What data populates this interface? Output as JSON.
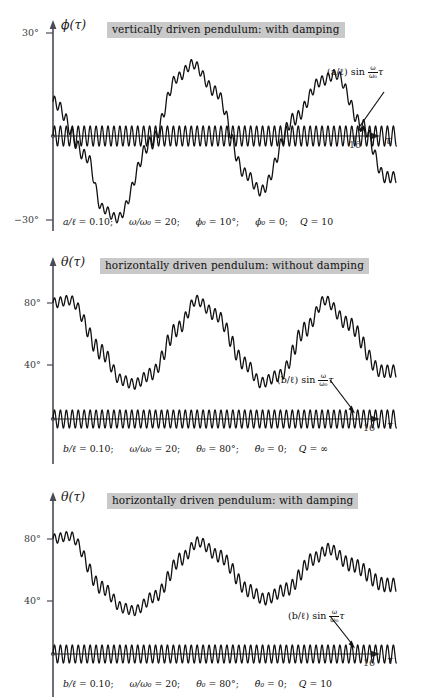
{
  "figure": {
    "type": "multi-panel-line-plot",
    "panel_count": 3,
    "background": "#ffffff",
    "banner_bg": "#c9c9c9",
    "curve_color": "#111111",
    "axis_color": "#4a4a56"
  },
  "panels": [
    {
      "id": "panel-1",
      "title": "vertically driven pendulum: with damping",
      "y_axis_label": "ϕ(τ)",
      "x_axis_label": "τ",
      "y_ticks": [
        "30°",
        "−30°"
      ],
      "y_tick_values": [
        30,
        -30
      ],
      "x_tick": "16",
      "x_tick_value": 16,
      "annotation": {
        "prefix": "(a/ℓ) sin",
        "frac_num": "ω",
        "frac_den": "ω₀",
        "suffix": "τ",
        "full": "(a/ℓ) sin (ω/ω₀)τ"
      },
      "params": [
        {
          "symbol": "a/ℓ",
          "value": "0.10"
        },
        {
          "symbol": "ω/ω₀",
          "value": "20"
        },
        {
          "symbol": "ϕ₀",
          "value": "10°"
        },
        {
          "symbol": "ϕ̇₀",
          "value": "0"
        },
        {
          "symbol": "Q",
          "value": "10"
        }
      ]
    },
    {
      "id": "panel-2",
      "title": "horizontally driven pendulum: without damping",
      "y_axis_label": "θ(τ)",
      "x_axis_label": "τ",
      "y_ticks": [
        "80°",
        "40°"
      ],
      "y_tick_values": [
        80,
        40
      ],
      "x_tick": "16",
      "x_tick_value": 16,
      "annotation": {
        "prefix": "(b/ℓ) sin",
        "frac_num": "ω",
        "frac_den": "ω₀",
        "suffix": "τ",
        "full": "(b/ℓ) sin (ω/ω₀)τ"
      },
      "params": [
        {
          "symbol": "b/ℓ",
          "value": "0.10"
        },
        {
          "symbol": "ω/ω₀",
          "value": "20"
        },
        {
          "symbol": "θ₀",
          "value": "80°"
        },
        {
          "symbol": "θ̇₀",
          "value": "0"
        },
        {
          "symbol": "Q",
          "value": "∞"
        }
      ]
    },
    {
      "id": "panel-3",
      "title": "horizontally driven pendulum: with damping",
      "y_axis_label": "θ(τ)",
      "x_axis_label": "τ",
      "y_ticks": [
        "80°",
        "40°"
      ],
      "y_tick_values": [
        80,
        40
      ],
      "x_tick": "16",
      "x_tick_value": 16,
      "annotation": {
        "prefix": "(b/ℓ) sin",
        "frac_num": "ω",
        "frac_den": "ω₀",
        "suffix": "τ",
        "full": "(b/ℓ) sin (ω/ω₀)τ"
      },
      "params": [
        {
          "symbol": "b/ℓ",
          "value": "0.10"
        },
        {
          "symbol": "ω/ω₀",
          "value": "20"
        },
        {
          "symbol": "θ₀",
          "value": "80°"
        },
        {
          "symbol": "θ̇₀",
          "value": "0"
        },
        {
          "symbol": "Q",
          "value": "10"
        }
      ]
    }
  ],
  "chart_data": [
    {
      "type": "line",
      "title": "vertically driven pendulum: with damping",
      "xlabel": "τ",
      "ylabel": "ϕ(τ)",
      "xlim": [
        0,
        18.2
      ],
      "ylim": [
        -30,
        30
      ],
      "grid": false,
      "legend": false,
      "series": [
        {
          "name": "ϕ(τ) response",
          "description": "slow large-amplitude oscillation, period ~7.2 in τ, amplitude ~22°, with superimposed fast ripple of ~1.5° at the drive frequency; weak damping (Q=10)",
          "model": {
            "slow_amplitude_deg": 22,
            "slow_period_tau": 7.2,
            "slow_phase_deg": 10,
            "ripple_amplitude_deg": 1.5,
            "ripple_period_tau": 0.315,
            "damping_Q": 10
          },
          "key_points": [
            {
              "tau": 0.0,
              "phi": 10
            },
            {
              "tau": 1.8,
              "phi": -6
            },
            {
              "tau": 2.6,
              "phi": -21
            },
            {
              "tau": 3.4,
              "phi": -24
            },
            {
              "tau": 5.2,
              "phi": -2
            },
            {
              "tau": 6.6,
              "phi": 17
            },
            {
              "tau": 7.4,
              "phi": 21
            },
            {
              "tau": 8.6,
              "phi": 13
            },
            {
              "tau": 10.2,
              "phi": -11
            },
            {
              "tau": 11.0,
              "phi": -16
            },
            {
              "tau": 12.8,
              "phi": 5
            },
            {
              "tau": 14.2,
              "phi": 16
            },
            {
              "tau": 15.0,
              "phi": 18
            },
            {
              "tau": 16.4,
              "phi": 3
            },
            {
              "tau": 17.6,
              "phi": -12
            }
          ]
        },
        {
          "name": "(a/ℓ) sin (ω/ω₀)τ drive",
          "description": "small high-frequency drive signal centered on the τ axis",
          "model": {
            "amplitude_deg": 3.0,
            "period_tau": 0.315
          }
        }
      ]
    },
    {
      "type": "line",
      "title": "horizontally driven pendulum: without damping",
      "xlabel": "τ",
      "ylabel": "θ(τ)",
      "xlim": [
        0,
        18.2
      ],
      "ylim": [
        0,
        95
      ],
      "grid": false,
      "legend": false,
      "series": [
        {
          "name": "θ(τ) response",
          "description": "undamped anharmonic oscillation between ~23° and ~82°, period ~5.8 in τ, with strong fast ripple largest near the troughs",
          "model": {
            "mean_deg": 52,
            "amplitude_deg": 29,
            "period_tau": 5.8,
            "ripple_amplitude_deg": 4.5,
            "ripple_period_tau": 0.315,
            "damping_Q": null
          },
          "key_points": [
            {
              "tau": 0.0,
              "theta": 80
            },
            {
              "tau": 0.9,
              "theta": 82
            },
            {
              "tau": 2.6,
              "theta": 46
            },
            {
              "tau": 3.6,
              "theta": 27
            },
            {
              "tau": 4.3,
              "theta": 24
            },
            {
              "tau": 5.2,
              "theta": 31
            },
            {
              "tau": 6.6,
              "theta": 62
            },
            {
              "tau": 7.6,
              "theta": 82
            },
            {
              "tau": 8.6,
              "theta": 72
            },
            {
              "tau": 10.2,
              "theta": 38
            },
            {
              "tau": 11.0,
              "theta": 25
            },
            {
              "tau": 12.0,
              "theta": 30
            },
            {
              "tau": 13.4,
              "theta": 62
            },
            {
              "tau": 14.4,
              "theta": 82
            },
            {
              "tau": 15.6,
              "theta": 66
            },
            {
              "tau": 17.4,
              "theta": 33
            }
          ]
        },
        {
          "name": "(b/ℓ) sin (ω/ω₀)τ drive",
          "description": "small high-frequency drive signal centered on the τ axis",
          "model": {
            "amplitude_deg": 4.0,
            "period_tau": 0.315
          }
        }
      ]
    },
    {
      "type": "line",
      "title": "horizontally driven pendulum: with damping",
      "xlabel": "τ",
      "ylabel": "θ(τ)",
      "xlim": [
        0,
        18.2
      ],
      "ylim": [
        0,
        95
      ],
      "grid": false,
      "legend": false,
      "series": [
        {
          "name": "θ(τ) response",
          "description": "damped oscillation (Q=10): successive peaks decay 82°, 78°, 73° while troughs rise 30°, 37°, 42°, converging toward ~55°; fast ripple superimposed",
          "model": {
            "mean_deg": 55,
            "initial_amplitude_deg": 27,
            "period_tau": 5.9,
            "ripple_amplitude_deg": 4.0,
            "ripple_period_tau": 0.315,
            "damping_Q": 10
          },
          "key_points": [
            {
              "tau": 0.0,
              "theta": 80
            },
            {
              "tau": 0.9,
              "theta": 82
            },
            {
              "tau": 2.6,
              "theta": 46
            },
            {
              "tau": 3.7,
              "theta": 32
            },
            {
              "tau": 4.3,
              "theta": 30
            },
            {
              "tau": 5.4,
              "theta": 40
            },
            {
              "tau": 6.8,
              "theta": 66
            },
            {
              "tau": 7.7,
              "theta": 78
            },
            {
              "tau": 8.8,
              "theta": 68
            },
            {
              "tau": 10.4,
              "theta": 44
            },
            {
              "tau": 11.2,
              "theta": 38
            },
            {
              "tau": 12.4,
              "theta": 45
            },
            {
              "tau": 13.8,
              "theta": 66
            },
            {
              "tau": 14.6,
              "theta": 73
            },
            {
              "tau": 15.8,
              "theta": 62
            },
            {
              "tau": 17.6,
              "theta": 48
            }
          ]
        },
        {
          "name": "(b/ℓ) sin (ω/ω₀)τ drive",
          "description": "small high-frequency drive signal centered on the τ axis",
          "model": {
            "amplitude_deg": 4.0,
            "period_tau": 0.315
          }
        }
      ]
    }
  ]
}
